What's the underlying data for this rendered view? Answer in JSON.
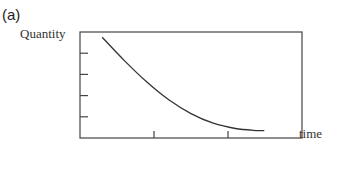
{
  "panel_label": "(a)",
  "chart_data": {
    "type": "line",
    "title": "",
    "panel": "(a)",
    "xlabel": "time",
    "ylabel": "Quantity",
    "x_ticks": 2,
    "y_ticks": 4,
    "tick_labels": false,
    "grid": false,
    "legend": null,
    "series": [
      {
        "name": "quantity",
        "x": [
          0.1,
          0.2,
          0.3,
          0.4,
          0.5,
          0.6,
          0.7,
          0.8,
          0.83
        ],
        "y": [
          0.95,
          0.73,
          0.53,
          0.36,
          0.23,
          0.14,
          0.09,
          0.07,
          0.07
        ]
      }
    ],
    "xlim": [
      0,
      1
    ],
    "ylim": [
      0,
      1
    ]
  }
}
